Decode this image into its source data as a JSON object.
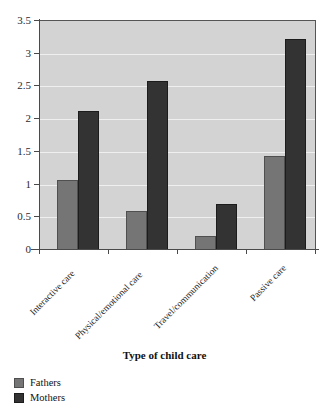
{
  "chart_data": {
    "type": "bar",
    "title": "",
    "xlabel": "Type of child care",
    "ylabel": "",
    "ylim": [
      0,
      3.5
    ],
    "ytick_labels": [
      "0",
      "0.5",
      "1",
      "1.5",
      "2",
      "2.5",
      "3",
      "3.5"
    ],
    "ytick_values": [
      0,
      0.5,
      1,
      1.5,
      2,
      2.5,
      3,
      3.5
    ],
    "grid": true,
    "legend_position": "below-left",
    "categories": [
      "Interactive care",
      "Physical/emotional care",
      "Travel/communication",
      "Passive care"
    ],
    "series": [
      {
        "name": "Fathers",
        "color": "#757575",
        "values": [
          1.07,
          0.6,
          0.22,
          1.43
        ]
      },
      {
        "name": "Mothers",
        "color": "#333333",
        "values": [
          2.12,
          2.59,
          0.71,
          3.23
        ]
      }
    ]
  },
  "legend": {
    "items": [
      {
        "label": "Fathers",
        "swatch": "fathers"
      },
      {
        "label": "Mothers",
        "swatch": "mothers"
      }
    ]
  },
  "axis": {
    "x_title": "Type of child care"
  }
}
